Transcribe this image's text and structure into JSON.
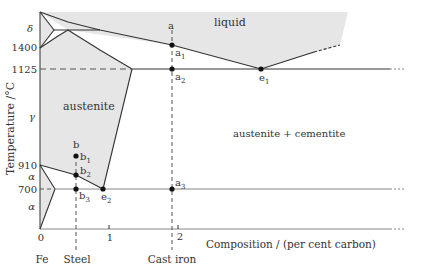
{
  "colors": {
    "region_fill": "#e6e6e6",
    "line": "#333333",
    "grid": "#888888",
    "text": "#333333"
  },
  "axes": {
    "ylabel": "Temperature /°C",
    "xlabel": "Composition / (per cent carbon)",
    "y_ticks": [
      "1400",
      "1125",
      "910",
      "700"
    ],
    "x_ticks": [
      "0",
      "1",
      "2"
    ],
    "x_categories": [
      "Fe",
      "Steel",
      "Cast iron"
    ]
  },
  "regions": {
    "liquid": "liquid",
    "austenite": "austenite",
    "austenite_cementite": "austenite + cementite",
    "delta": "δ",
    "gamma": "γ",
    "alpha_upper": "α",
    "alpha_lower": "α"
  },
  "points": {
    "a": "a",
    "a1": "a",
    "a1_sub": "1",
    "a2": "a",
    "a2_sub": "2",
    "a3": "a",
    "a3_sub": "3",
    "b": "b",
    "b1": "b",
    "b1_sub": "1",
    "b2": "b",
    "b2_sub": "2",
    "b3": "b",
    "b3_sub": "3",
    "e1": "e",
    "e1_sub": "1",
    "e2": "e",
    "e2_sub": "2"
  }
}
